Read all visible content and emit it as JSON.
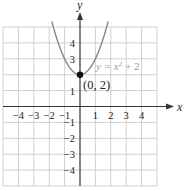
{
  "chart_data": {
    "type": "line",
    "title": "",
    "xlabel": "x",
    "ylabel": "y",
    "xlim": [
      -5,
      5
    ],
    "ylim": [
      -5,
      5
    ],
    "grid": true,
    "x_ticks": [
      -4,
      -3,
      -2,
      -1,
      1,
      2,
      3,
      4
    ],
    "x_tick_labels": [
      "−4",
      "−3",
      "−2",
      "−1",
      "1",
      "2",
      "3",
      "4"
    ],
    "y_ticks": [
      4,
      3,
      1,
      -1,
      -2,
      -3,
      -4
    ],
    "y_tick_labels": [
      "4",
      "3",
      "1",
      "−1",
      "−2",
      "−3",
      "−4"
    ],
    "series": [
      {
        "name": "y = x² + 2",
        "function": "x^2 + 2",
        "x": [
          -1.73,
          -1.5,
          -1,
          -0.5,
          0,
          0.5,
          1,
          1.5,
          1.73
        ],
        "y": [
          5.0,
          4.25,
          3,
          2.25,
          2,
          2.25,
          3,
          4.25,
          5.0
        ],
        "color": "#808080"
      }
    ],
    "annotations": [
      {
        "text": "(0, 2)",
        "x": 0,
        "y": 2,
        "type": "point"
      },
      {
        "text": "y = x² + 2",
        "type": "curve-label"
      }
    ]
  },
  "labels": {
    "x_axis": "x",
    "y_axis": "y",
    "point": "(0, 2)",
    "curve_eq_prefix": "y = x",
    "curve_eq_exp": "2",
    "curve_eq_suffix": " + 2"
  },
  "colors": {
    "grid": "#d0d0d0",
    "axis": "#333333",
    "curve": "#7f7f7f",
    "point": "#111111",
    "text": "#222222",
    "curve_label": "#9a9a9a"
  }
}
